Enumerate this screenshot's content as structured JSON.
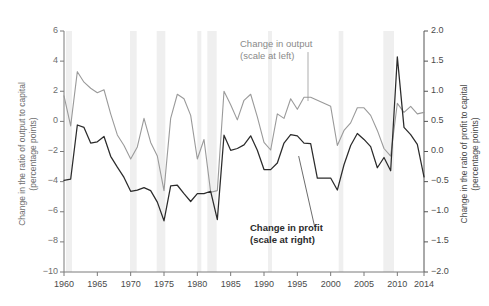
{
  "chart_data": {
    "type": "line",
    "title": "",
    "xlabel": "",
    "ylabel": "Change in the ratio of output to capital\n(percentage points)",
    "ylabel_right": "Change in the ratio of profit to capital\n(percentage points)",
    "xlim": [
      1960,
      2014
    ],
    "ylim": [
      -10,
      6
    ],
    "ylim_right": [
      -2.0,
      2.0
    ],
    "grid": false,
    "legend_position": "inline-annotations",
    "xticks": [
      1960,
      1965,
      1970,
      1975,
      1980,
      1985,
      1990,
      1995,
      2000,
      2005,
      2010,
      2014
    ],
    "xticklabels": [
      "1960",
      "1965",
      "1970",
      "1975",
      "1980",
      "1985",
      "1990",
      "1995",
      "2000",
      "2005",
      "2010",
      "2014"
    ],
    "yticks": [
      -10,
      -8,
      -6,
      -4,
      -2,
      0,
      2,
      4,
      6
    ],
    "yticklabels": [
      "−10",
      "−8",
      "−6",
      "−4",
      "−2",
      "0",
      "2",
      "4",
      "6"
    ],
    "yticks_right": [
      -2.0,
      -1.5,
      -1.0,
      -0.5,
      0.0,
      0.5,
      1.0,
      1.5,
      2.0
    ],
    "yticklabels_right": [
      "−2.0",
      "−1.5",
      "−1.0",
      "−0.5",
      "0.0",
      "0.5",
      "1.0",
      "1.5",
      "2.0"
    ],
    "annotations": [
      {
        "name": "output-label",
        "text": "Change in output\n(scale at left)",
        "color": "#8a8a8a",
        "leader_from": [
          1996.6,
          4.6
        ],
        "leader_to": [
          1996.6,
          1.35
        ]
      },
      {
        "name": "profit-label",
        "text": "Change in profit\n(scale at right)",
        "color": "#2b2b2b",
        "leader_from": [
          1997.6,
          -7.0
        ],
        "leader_to": [
          1995.2,
          -2.3
        ]
      }
    ],
    "recession_bands": [
      {
        "start": 1960.3,
        "end": 1961.2
      },
      {
        "start": 1969.9,
        "end": 1970.9
      },
      {
        "start": 1973.9,
        "end": 1975.2
      },
      {
        "start": 1980.0,
        "end": 1980.6
      },
      {
        "start": 1981.5,
        "end": 1982.9
      },
      {
        "start": 1990.6,
        "end": 1991.2
      },
      {
        "start": 2001.2,
        "end": 2001.9
      },
      {
        "start": 2007.9,
        "end": 2009.5
      }
    ],
    "x": [
      1960,
      1961,
      1962,
      1963,
      1964,
      1965,
      1966,
      1967,
      1968,
      1969,
      1970,
      1971,
      1972,
      1973,
      1974,
      1975,
      1976,
      1977,
      1978,
      1979,
      1980,
      1981,
      1982,
      1983,
      1984,
      1985,
      1986,
      1987,
      1988,
      1989,
      1990,
      1991,
      1992,
      1993,
      1994,
      1995,
      1996,
      1997,
      1998,
      1999,
      2000,
      2001,
      2002,
      2003,
      2004,
      2005,
      2006,
      2007,
      2008,
      2009,
      2010,
      2011,
      2012,
      2013,
      2014
    ],
    "series": [
      {
        "name": "Change in output",
        "scale": "left",
        "color": "#9a9a9a",
        "values": [
          1.7,
          -0.3,
          3.3,
          2.6,
          2.2,
          1.9,
          2.1,
          0.5,
          -0.9,
          -1.6,
          -2.5,
          -1.7,
          0.2,
          -1.4,
          -2.3,
          -4.6,
          0.2,
          1.8,
          1.5,
          0.4,
          -2.5,
          -1.2,
          -4.7,
          -4.6,
          2.0,
          1.1,
          0.1,
          1.4,
          1.8,
          0.3,
          -1.4,
          -1.9,
          0.5,
          0.2,
          1.5,
          0.8,
          1.6,
          1.6,
          1.4,
          1.2,
          1.0,
          -1.6,
          -0.6,
          -0.1,
          0.9,
          0.9,
          0.4,
          -0.6,
          -1.8,
          -2.3,
          1.2,
          0.6,
          1.0,
          0.5,
          0.6
        ]
      },
      {
        "name": "Change in profit",
        "scale": "right",
        "color": "#2b2b2b",
        "values": [
          -0.48,
          -0.46,
          0.44,
          0.4,
          0.14,
          0.16,
          0.25,
          -0.08,
          -0.26,
          -0.43,
          -0.66,
          -0.64,
          -0.6,
          -0.65,
          -0.84,
          -1.15,
          -0.57,
          -0.56,
          -0.7,
          -0.83,
          -0.7,
          -0.7,
          -0.66,
          -1.13,
          0.27,
          0.02,
          0.05,
          0.11,
          0.26,
          0.02,
          -0.3,
          -0.3,
          -0.19,
          0.14,
          0.28,
          0.26,
          0.14,
          0.13,
          -0.44,
          -0.44,
          -0.44,
          -0.64,
          -0.22,
          0.1,
          0.3,
          0.2,
          0.08,
          -0.27,
          -0.1,
          -0.32,
          1.57,
          0.4,
          0.28,
          0.12,
          -0.42
        ]
      }
    ]
  }
}
